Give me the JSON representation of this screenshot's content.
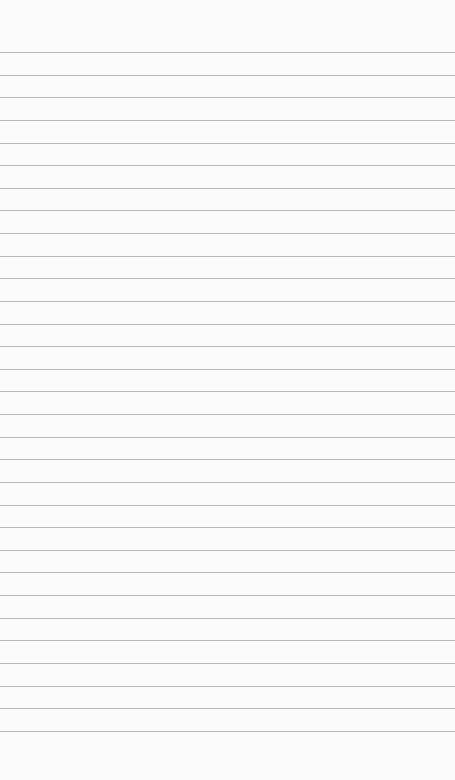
{
  "paper": {
    "type": "lined-notebook-paper",
    "background_color": "#fbfbfb",
    "line_color": "#b8b8b8",
    "line_count": 31,
    "first_line_y": 52,
    "line_spacing": 22.63
  }
}
